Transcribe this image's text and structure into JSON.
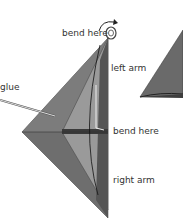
{
  "labels": {
    "bend_here_top": "bend here",
    "left_arm": "left arm",
    "glue": "glue",
    "bend_here_mid": "bend here",
    "right_arm": "right arm"
  },
  "colors": {
    "dark_gray": "#5a5a5a",
    "mid_gray": "#7a7a7a",
    "light_gray": "#9a9a9a",
    "outline": "#222222",
    "text": "#333333"
  }
}
